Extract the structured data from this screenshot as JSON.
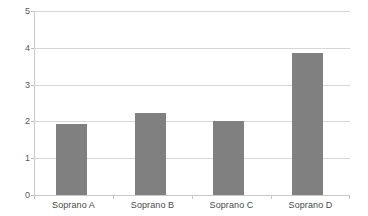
{
  "chart_data": {
    "type": "bar",
    "title": "",
    "subtitle": "",
    "xlabel": "",
    "ylabel": "",
    "categories": [
      "Soprano A",
      "Soprano B",
      "Soprano C",
      "Soprano D"
    ],
    "values": [
      1.92,
      2.22,
      2.0,
      3.87
    ],
    "ylim": [
      0,
      5
    ],
    "ytick_labels": [
      "0",
      "1",
      "2",
      "3",
      "4",
      "5"
    ],
    "ytick_values": [
      0,
      1,
      2,
      3,
      4,
      5
    ],
    "grid": "horizontal",
    "legend": "none",
    "bar_color": "#808080",
    "gridline_color": "#d6d6d6",
    "axis_color": "#c9c9c9",
    "background_color": "#ffffff"
  }
}
